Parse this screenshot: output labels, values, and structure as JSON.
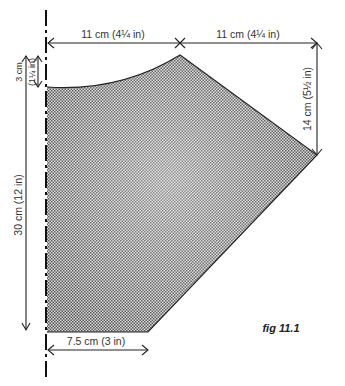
{
  "figure": {
    "caption": "fig 11.1",
    "colors": {
      "shape_fill": "#9a9a9a",
      "outline": "#222222",
      "background": "#ffffff"
    }
  },
  "dimensions": {
    "top_left_width": "11 cm (4¼ in)",
    "top_right_width": "11 cm (4¼ in)",
    "right_height": "14 cm (5½ in)",
    "top_drop": "3 cm",
    "top_drop_imperial": "(1¼ in)",
    "total_height": "30 cm (12 in)",
    "bottom_width": "7.5 cm (3 in)"
  }
}
